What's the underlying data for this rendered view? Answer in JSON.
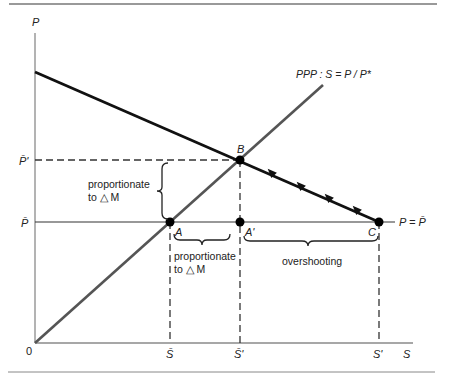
{
  "diagram": {
    "type": "economics-overshooting-diagram",
    "axes": {
      "y_label": "P",
      "x_label": "S",
      "origin_label": "0"
    },
    "y_ticks": {
      "p_bar_prime": "P̄'",
      "p_bar": "P̄"
    },
    "x_ticks": {
      "s_bar": "S̄",
      "s_bar_prime": "S̄'",
      "s_prime": "S'"
    },
    "lines": {
      "ppp_label": "PPP : S = P / P*",
      "p_equals_pbar_label": "P = P̄"
    },
    "points": {
      "a": "A",
      "a_prime": "A'",
      "b": "B",
      "c": "C"
    },
    "annotations": {
      "vertical_brace_line1": "proportionate",
      "vertical_brace_line2": "to △ M",
      "horizontal_brace_line1": "proportionate",
      "horizontal_brace_line2": "to △ M",
      "overshooting": "overshooting"
    },
    "colors": {
      "axis": "#8a8a8a",
      "adjustment_line": "#111111",
      "ppp_line": "#555555",
      "rule": "#777777"
    }
  }
}
